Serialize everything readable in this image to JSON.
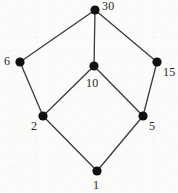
{
  "figure": {
    "kind": "hasse-diagram",
    "background_color": "#fbfbfa",
    "node_color": "#111111",
    "edge_color": "#3a3a3a",
    "label_color": "#262626",
    "node_radius": 4.6,
    "edge_width": 1.3,
    "width": 178,
    "height": 193
  },
  "chart_data": {
    "type": "diagram",
    "title": "",
    "nodes": [
      {
        "id": "n30",
        "label": "30",
        "x": 95,
        "y": 10,
        "label_x": 102,
        "label_y": 0,
        "label_anchor": "upper-right"
      },
      {
        "id": "n6",
        "label": "6",
        "x": 20,
        "y": 62,
        "label_x": 4,
        "label_y": 55,
        "label_anchor": "left"
      },
      {
        "id": "n10",
        "label": "10",
        "x": 94,
        "y": 66,
        "label_x": 86,
        "label_y": 77,
        "label_anchor": "below"
      },
      {
        "id": "n15",
        "label": "15",
        "x": 157,
        "y": 62,
        "label_x": 163,
        "label_y": 66,
        "label_anchor": "right"
      },
      {
        "id": "n2",
        "label": "2",
        "x": 43,
        "y": 116,
        "label_x": 31,
        "label_y": 120,
        "label_anchor": "lower-left"
      },
      {
        "id": "n5",
        "label": "5",
        "x": 143,
        "y": 116,
        "label_x": 149,
        "label_y": 120,
        "label_anchor": "lower-right"
      },
      {
        "id": "n1",
        "label": "1",
        "x": 97,
        "y": 171,
        "label_x": 93,
        "label_y": 179,
        "label_anchor": "below"
      }
    ],
    "edges": [
      {
        "from": "n6",
        "to": "n30"
      },
      {
        "from": "n10",
        "to": "n30"
      },
      {
        "from": "n15",
        "to": "n30"
      },
      {
        "from": "n2",
        "to": "n6"
      },
      {
        "from": "n2",
        "to": "n10"
      },
      {
        "from": "n5",
        "to": "n10"
      },
      {
        "from": "n5",
        "to": "n15"
      },
      {
        "from": "n1",
        "to": "n2"
      },
      {
        "from": "n1",
        "to": "n5"
      }
    ]
  }
}
